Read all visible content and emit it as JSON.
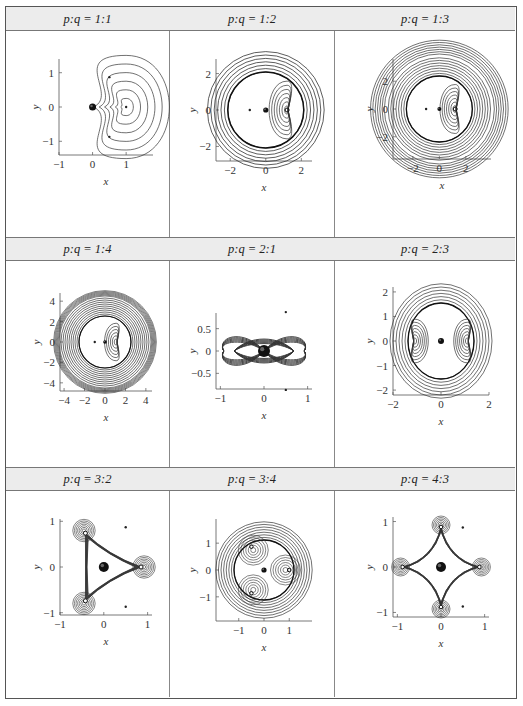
{
  "table": {
    "cells": [
      {
        "p": "1",
        "q": "1",
        "label_prefix": "p",
        "label_q": "q",
        "ratio": "1:1",
        "xticks": [
          "-1",
          "0",
          "1"
        ],
        "yticks": [
          "1",
          "0",
          "-1"
        ],
        "xlabel": "x",
        "ylabel": "y"
      },
      {
        "p": "1",
        "q": "2",
        "ratio": "1:2",
        "xticks": [
          "-2",
          "0",
          "2"
        ],
        "yticks": [
          "2",
          "0",
          "-2"
        ],
        "xlabel": "x",
        "ylabel": "y"
      },
      {
        "p": "1",
        "q": "3",
        "ratio": "1:3",
        "xticks": [
          "-2",
          "0",
          "2"
        ],
        "yticks": [
          "2",
          "0",
          "-2"
        ],
        "xlabel": "x",
        "ylabel": "y"
      },
      {
        "p": "1",
        "q": "4",
        "ratio": "1:4",
        "xticks": [
          "-4",
          "-2",
          "0",
          "2",
          "4"
        ],
        "yticks": [
          "4",
          "2",
          "0",
          "-2",
          "-4"
        ],
        "xlabel": "x",
        "ylabel": "y"
      },
      {
        "p": "2",
        "q": "1",
        "ratio": "2:1",
        "xticks": [
          "-1",
          "0",
          "1"
        ],
        "yticks": [
          "0.5",
          "0",
          "-0.5"
        ],
        "xlabel": "x",
        "ylabel": "y"
      },
      {
        "p": "2",
        "q": "3",
        "ratio": "2:3",
        "xticks": [
          "-2",
          "0",
          "2"
        ],
        "yticks": [
          "2",
          "1",
          "0",
          "-1",
          "-2"
        ],
        "xlabel": "x",
        "ylabel": "y"
      },
      {
        "p": "3",
        "q": "2",
        "ratio": "3:2",
        "xticks": [
          "-1",
          "0",
          "1"
        ],
        "yticks": [
          "1",
          "0",
          "-1"
        ],
        "xlabel": "x",
        "ylabel": "y"
      },
      {
        "p": "3",
        "q": "4",
        "ratio": "3:4",
        "xticks": [
          "-1",
          "0",
          "1"
        ],
        "yticks": [
          "1",
          "0",
          "-1"
        ],
        "xlabel": "x",
        "ylabel": "y"
      },
      {
        "p": "4",
        "q": "3",
        "ratio": "4:3",
        "xticks": [
          "-1",
          "0",
          "1"
        ],
        "yticks": [
          "1",
          "0",
          "-1"
        ],
        "xlabel": "x",
        "ylabel": "y"
      }
    ],
    "header_labels": [
      "p:q = 1:1",
      "p:q = 1:2",
      "p:q = 1:3",
      "p:q = 1:4",
      "p:q = 2:1",
      "p:q = 2:3",
      "p:q = 3:2",
      "p:q = 3:4",
      "p:q = 4:3"
    ]
  },
  "chart_data": [
    {
      "type": "contour",
      "title": "p:q = 1:1",
      "xlabel": "x",
      "ylabel": "y",
      "xlim": [
        -1,
        1.8
      ],
      "ylim": [
        -1.4,
        1.4
      ],
      "xticks": [
        -1,
        0,
        1
      ],
      "yticks": [
        -1,
        0,
        1
      ]
    },
    {
      "type": "contour",
      "title": "p:q = 1:2",
      "xlabel": "x",
      "ylabel": "y",
      "xlim": [
        -2.8,
        2.6
      ],
      "ylim": [
        -2.8,
        2.8
      ],
      "xticks": [
        -2,
        0,
        2
      ],
      "yticks": [
        -2,
        0,
        2
      ]
    },
    {
      "type": "contour",
      "title": "p:q = 1:3",
      "xlabel": "x",
      "ylabel": "y",
      "xlim": [
        -3.5,
        3.9
      ],
      "ylim": [
        -3.6,
        3.6
      ],
      "xticks": [
        -2,
        0,
        2
      ],
      "yticks": [
        -2,
        0,
        2
      ]
    },
    {
      "type": "contour",
      "title": "p:q = 1:4",
      "xlabel": "x",
      "ylabel": "y",
      "xlim": [
        -4.4,
        4.6
      ],
      "ylim": [
        -4.8,
        4.8
      ],
      "xticks": [
        -4,
        -2,
        0,
        2,
        4
      ],
      "yticks": [
        -4,
        -2,
        0,
        2,
        4
      ]
    },
    {
      "type": "contour",
      "title": "p:q = 2:1",
      "xlabel": "x",
      "ylabel": "y",
      "xlim": [
        -1.1,
        1.1
      ],
      "ylim": [
        -0.85,
        0.85
      ],
      "xticks": [
        -1,
        0,
        1
      ],
      "yticks": [
        -0.5,
        0,
        0.5
      ]
    },
    {
      "type": "contour",
      "title": "p:q = 2:3",
      "xlabel": "x",
      "ylabel": "y",
      "xlim": [
        -2,
        2
      ],
      "ylim": [
        -2.2,
        2.2
      ],
      "xticks": [
        -2,
        0,
        2
      ],
      "yticks": [
        -2,
        -1,
        0,
        1,
        2
      ]
    },
    {
      "type": "contour",
      "title": "p:q = 3:2",
      "xlabel": "x",
      "ylabel": "y",
      "xlim": [
        -1,
        1.1
      ],
      "ylim": [
        -1.05,
        1.05
      ],
      "xticks": [
        -1,
        0,
        1
      ],
      "yticks": [
        -1,
        0,
        1
      ]
    },
    {
      "type": "contour",
      "title": "p:q = 3:4",
      "xlabel": "x",
      "ylabel": "y",
      "xlim": [
        -1.9,
        1.9
      ],
      "ylim": [
        -1.9,
        1.9
      ],
      "xticks": [
        -1,
        0,
        1
      ],
      "yticks": [
        -1,
        0,
        1
      ]
    },
    {
      "type": "contour",
      "title": "p:q = 4:3",
      "xlabel": "x",
      "ylabel": "y",
      "xlim": [
        -1.1,
        1.1
      ],
      "ylim": [
        -1.1,
        1.1
      ],
      "xticks": [
        -1,
        0,
        1
      ],
      "yticks": [
        -1,
        0,
        1
      ]
    }
  ]
}
